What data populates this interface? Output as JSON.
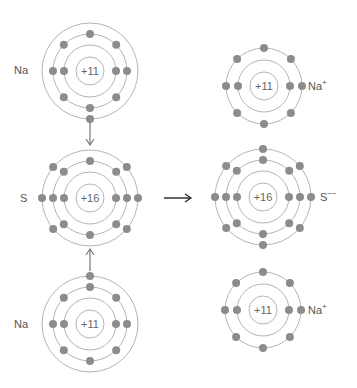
{
  "colors": {
    "ring": "#b5b5b5",
    "electron": "#8c8c8c",
    "arrow": "#777777",
    "main_arrow": "#222222",
    "text": "#555555"
  },
  "atoms": [
    {
      "id": "na-top",
      "symbol": "Na",
      "charge_label": "+11",
      "cx": 90,
      "cy": 71,
      "label_x": 14,
      "label_y": 64,
      "label_side": "left",
      "superscript": "",
      "shells": [
        {
          "r": 26,
          "angles": [
            0,
            180
          ]
        },
        {
          "r": 37,
          "angles": [
            0,
            45,
            90,
            135,
            180,
            225,
            270,
            315
          ]
        },
        {
          "r": 48,
          "angles": [
            90
          ]
        }
      ]
    },
    {
      "id": "s-left",
      "symbol": "S",
      "charge_label": "+16",
      "cx": 90,
      "cy": 198,
      "label_x": 14,
      "label_y": 191,
      "label_side": "left",
      "superscript": "",
      "shells": [
        {
          "r": 26,
          "angles": [
            0,
            180
          ]
        },
        {
          "r": 37,
          "angles": [
            0,
            45,
            90,
            135,
            180,
            225,
            270,
            315
          ]
        },
        {
          "r": 48,
          "angles": [
            0,
            40,
            140,
            180,
            220,
            320
          ]
        }
      ]
    },
    {
      "id": "na-bottom",
      "symbol": "Na",
      "charge_label": "+11",
      "cx": 90,
      "cy": 324,
      "label_x": 14,
      "label_y": 317,
      "label_side": "left",
      "superscript": "",
      "shells": [
        {
          "r": 26,
          "angles": [
            0,
            180
          ]
        },
        {
          "r": 37,
          "angles": [
            0,
            45,
            90,
            135,
            180,
            225,
            270,
            315
          ]
        },
        {
          "r": 48,
          "angles": [
            270
          ]
        }
      ]
    },
    {
      "id": "na-ion-top",
      "symbol": "Na",
      "charge_label": "+11",
      "cx": 264,
      "cy": 86,
      "label_x": 308,
      "label_y": 79,
      "label_side": "right",
      "superscript": "+",
      "shells": [
        {
          "r": 26,
          "angles": [
            0,
            180
          ]
        },
        {
          "r": 38,
          "angles": [
            0,
            45,
            90,
            135,
            180,
            225,
            270,
            315
          ]
        }
      ]
    },
    {
      "id": "s-ion",
      "symbol": "S",
      "charge_label": "+16",
      "cx": 263,
      "cy": 197,
      "label_x": 320,
      "label_y": 190,
      "label_side": "right",
      "superscript": "−−",
      "shells": [
        {
          "r": 26,
          "angles": [
            0,
            180
          ]
        },
        {
          "r": 37,
          "angles": [
            0,
            45,
            90,
            135,
            180,
            225,
            270,
            315
          ]
        },
        {
          "r": 48,
          "angles": [
            0,
            40,
            90,
            140,
            180,
            220,
            270,
            320
          ]
        }
      ]
    },
    {
      "id": "na-ion-bottom",
      "symbol": "Na",
      "charge_label": "+11",
      "cx": 263,
      "cy": 310,
      "label_x": 308,
      "label_y": 303,
      "label_side": "right",
      "superscript": "+",
      "shells": [
        {
          "r": 26,
          "angles": [
            0,
            180
          ]
        },
        {
          "r": 38,
          "angles": [
            0,
            45,
            90,
            135,
            180,
            225,
            270,
            315
          ]
        }
      ]
    }
  ],
  "arrows": [
    {
      "id": "arrow-down",
      "x1": 90,
      "y1": 122,
      "x2": 90,
      "y2": 145
    },
    {
      "id": "arrow-up",
      "x1": 90,
      "y1": 271,
      "x2": 90,
      "y2": 249
    },
    {
      "id": "arrow-reaction",
      "x1": 164,
      "y1": 198,
      "x2": 191,
      "y2": 198
    }
  ],
  "labels": {
    "na_top": "Na",
    "s_left": "S",
    "na_bottom": "Na",
    "na_ion_top": "Na",
    "na_ion_top_sup": "+",
    "s_ion": "S",
    "s_ion_sup": "−−",
    "na_ion_bottom": "Na",
    "na_ion_bottom_sup": "+"
  },
  "nuclei": {
    "na_top": "+11",
    "s_left": "+16",
    "na_bottom": "+11",
    "na_ion_top": "+11",
    "s_ion": "+16",
    "na_ion_bottom": "+11"
  }
}
